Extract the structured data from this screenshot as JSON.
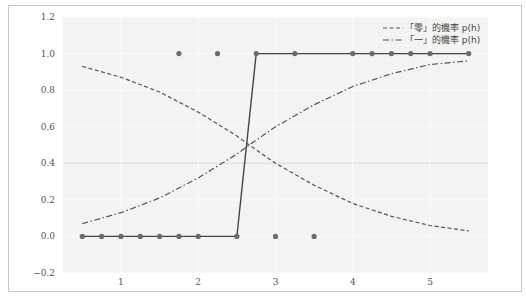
{
  "chart_data": {
    "type": "line",
    "title": "",
    "xlabel": "",
    "ylabel": "",
    "xlim": [
      0.25,
      5.75
    ],
    "ylim": [
      -0.2,
      1.2
    ],
    "xticks": [
      1,
      2,
      3,
      4,
      5
    ],
    "yticks": [
      -0.2,
      0.0,
      0.2,
      0.4,
      0.6,
      0.8,
      1.0,
      1.2
    ],
    "ytick_labels": [
      "−0.2",
      "0.0",
      "0.2",
      "0.4",
      "0.6",
      "0.8",
      "1.0",
      "1.2"
    ],
    "grid": true,
    "legend_position": "upper right",
    "legend": [
      {
        "label": "「零」的機率 p(h)",
        "style": "dashed"
      },
      {
        "label": "「一」的機率 p(h)",
        "style": "dashdot"
      }
    ],
    "series": [
      {
        "name": "step_classification",
        "style": "solid-with-markers",
        "x": [
          0.5,
          0.75,
          1.0,
          1.25,
          1.5,
          1.75,
          2.0,
          2.5,
          2.75,
          3.25,
          4.0,
          4.25,
          4.5,
          4.75,
          5.0,
          5.5
        ],
        "y": [
          0,
          0,
          0,
          0,
          0,
          0,
          0,
          0,
          1,
          1,
          1,
          1,
          1,
          1,
          1,
          1
        ]
      },
      {
        "name": "outliers",
        "style": "markers",
        "x": [
          1.75,
          2.25,
          3.0,
          3.5
        ],
        "y": [
          1,
          1,
          0,
          0
        ]
      },
      {
        "name": "「零」的機率 p(h)",
        "style": "dashed",
        "x": [
          0.5,
          1.0,
          1.5,
          2.0,
          2.5,
          2.66,
          3.0,
          3.5,
          4.0,
          4.5,
          5.0,
          5.5
        ],
        "y": [
          0.93,
          0.87,
          0.79,
          0.68,
          0.55,
          0.5,
          0.4,
          0.28,
          0.18,
          0.11,
          0.06,
          0.03
        ]
      },
      {
        "name": "「一」的機率 p(h)",
        "style": "dashdot",
        "x": [
          0.5,
          1.0,
          1.5,
          2.0,
          2.5,
          2.66,
          3.0,
          3.5,
          4.0,
          4.5,
          5.0,
          5.5
        ],
        "y": [
          0.07,
          0.13,
          0.21,
          0.32,
          0.45,
          0.5,
          0.6,
          0.72,
          0.82,
          0.89,
          0.94,
          0.96
        ]
      }
    ]
  },
  "colors": {
    "plot_bg": "#f3f3f3",
    "grid": "#fbfbfb",
    "line": "#555555",
    "marker": "#6a6a6a",
    "frame": "#c8c8c8"
  }
}
